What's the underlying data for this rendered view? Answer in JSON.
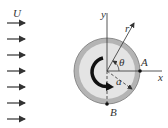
{
  "diagram": {
    "type": "flow-around-rotating-cylinder",
    "labels": {
      "freestream": "U",
      "y_axis": "y",
      "x_axis": "x",
      "radius_vector": "r",
      "angle": "θ",
      "cylinder_radius": "a",
      "point_A": "A",
      "point_B": "B"
    },
    "freestream_arrow_count": 7,
    "colors": {
      "cylinder_ring": "#a9a9a9",
      "cylinder_fill": "#e2e2e2",
      "lines": "#444444",
      "background": "#ffffff"
    }
  }
}
